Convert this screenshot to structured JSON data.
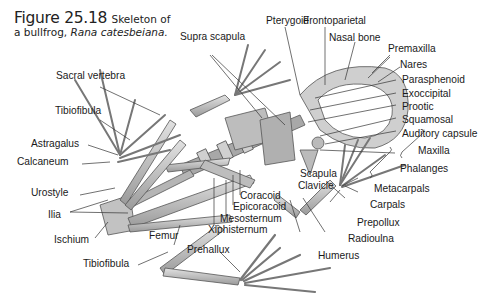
{
  "caption": {
    "figure_number": "Figure 25.18",
    "title_line1": "Skeleton of",
    "title_line2": "a bullfrog, ",
    "species": "Rana catesbeiana."
  },
  "labels": {
    "pterygoid": "Pterygoid",
    "frontoparietal": "Frontoparietal",
    "nasal_bone": "Nasal bone",
    "premaxilla": "Premaxilla",
    "nares": "Nares",
    "parasphenoid": "Parasphenoid",
    "exoccipital": "Exoccipital",
    "prootic": "Prootic",
    "squamosal": "Squamosal",
    "auditory_capsule": "Auditory capsule",
    "maxilla": "Maxilla",
    "phalanges": "Phalanges",
    "metacarpals": "Metacarpals",
    "carpals": "Carpals",
    "prepollux": "Prepollux",
    "radioulna": "Radioulna",
    "humerus": "Humerus",
    "scapula": "Scapula",
    "clavicle": "Clavicle",
    "supra_scapula": "Supra scapula",
    "sacral_vertebra": "Sacral vertebra",
    "tibiofibula_upper": "Tibiofibula",
    "astragalus": "Astragalus",
    "calcaneum": "Calcaneum",
    "urostyle": "Urostyle",
    "ilia": "Ilia",
    "ischium": "Ischium",
    "femur": "Femur",
    "tibiofibula_lower": "Tibiofibula",
    "prehallux": "Prehallux",
    "coracoid": "Coracoid",
    "epicoracoid": "Epicoracoid",
    "mesosternum": "Mesosternum",
    "xiphisternum": "Xiphisternum"
  },
  "colors": {
    "bone": "#c9c9c9",
    "bone_dark": "#7a7a7a",
    "leader_line": "#333333",
    "text": "#1a1a1a"
  }
}
